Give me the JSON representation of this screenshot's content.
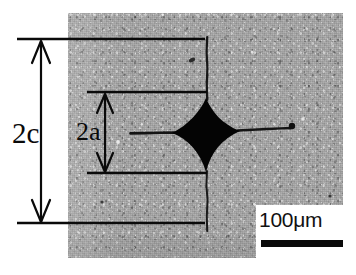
{
  "figure": {
    "type": "micrograph",
    "width": 356,
    "height": 275,
    "background_color": "#ffffff"
  },
  "micrograph": {
    "name": "polished-ceramic-surface-micrograph",
    "base_gray": "#a8a8a8",
    "bounds": {
      "x": 68,
      "y": 13,
      "w": 275,
      "h": 245
    }
  },
  "indentation": {
    "name": "vickers-indent-diamond",
    "color": "#000000",
    "center": {
      "x": 206,
      "y": 135
    },
    "half_width": 34,
    "half_height": 37
  },
  "cracks": [
    {
      "name": "radial-crack-left",
      "x1": 130,
      "y1": 133,
      "x2": 174,
      "y2": 133
    },
    {
      "name": "radial-crack-right",
      "x1": 238,
      "y1": 130,
      "x2": 291,
      "y2": 128
    },
    {
      "name": "radial-crack-up",
      "x1": 207,
      "y1": 37,
      "x2": 207,
      "y2": 100
    },
    {
      "name": "radial-crack-down",
      "x1": 207,
      "y1": 171,
      "x2": 207,
      "y2": 231
    }
  ],
  "inclusions": [
    {
      "name": "dark-inclusion-right",
      "cx": 292,
      "cy": 126,
      "r": 3.2
    },
    {
      "name": "dark-inclusion-upper",
      "cx": 192,
      "cy": 60,
      "r": 2.6
    },
    {
      "name": "dark-inclusion-lower",
      "cx": 102,
      "cy": 202,
      "r": 1.6
    },
    {
      "name": "dark-inclusion-far-right",
      "cx": 330,
      "cy": 196,
      "r": 1.6
    },
    {
      "name": "dark-inclusion-bottom",
      "cx": 297,
      "cy": 253,
      "r": 1.8
    },
    {
      "name": "light-fleck-left",
      "cx": 118,
      "cy": 142,
      "r": 1.8
    },
    {
      "name": "light-fleck-right",
      "cx": 303,
      "cy": 119,
      "r": 1.8
    }
  ],
  "dimensions": {
    "crack_length": {
      "name": "dimension-2c",
      "label": "2c",
      "label_pos": {
        "x": 12,
        "y": 118
      },
      "arrow_x": 41,
      "arrow_top_y": 40,
      "arrow_bottom_y": 223,
      "tick_lines": [
        {
          "y": 39,
          "x1": 17,
          "x2": 205
        },
        {
          "y": 223,
          "x1": 17,
          "x2": 205
        }
      ]
    },
    "indent_diagonal": {
      "name": "dimension-2a",
      "label": "2a",
      "label_pos": {
        "x": 76,
        "y": 118
      },
      "arrow_x": 105,
      "arrow_top_y": 93,
      "arrow_bottom_y": 172,
      "tick_lines": [
        {
          "y": 92,
          "x1": 87,
          "x2": 207
        },
        {
          "y": 173,
          "x1": 87,
          "x2": 207
        }
      ]
    }
  },
  "scale_bar": {
    "name": "scale-bar",
    "label": "100μm",
    "value": 100,
    "unit": "μm",
    "bar_color": "#0a0a0a",
    "box_color": "#ffffff"
  },
  "colors": {
    "ink": "#0a0a0a",
    "indent_fill": "#000000",
    "photo_gray": "#a8a8a8",
    "page_background": "#ffffff"
  }
}
